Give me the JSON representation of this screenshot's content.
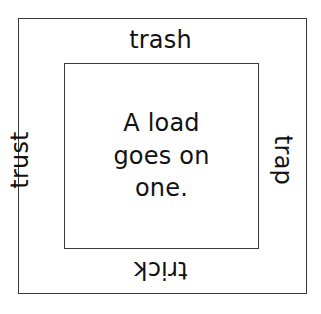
{
  "figure": {
    "background_color": "#ffffff",
    "line_color": "#3a3a3a",
    "text_color": "#121212",
    "outer_box": {
      "name": "outer-rectangle"
    },
    "inner_box": {
      "name": "inner-rectangle"
    },
    "edge_words": {
      "top": {
        "text": "trash",
        "orientation": "upright"
      },
      "left": {
        "text": "trust",
        "orientation": "rotated-90-counterclockwise"
      },
      "right": {
        "text": "trap",
        "orientation": "rotated-90-clockwise"
      },
      "bottom": {
        "text": "trick",
        "orientation": "rotated-180-upside-down"
      }
    },
    "center_sentence": {
      "full_text": "A load goes on one.",
      "lines": [
        "A  load",
        "goes  on",
        "one."
      ]
    }
  }
}
